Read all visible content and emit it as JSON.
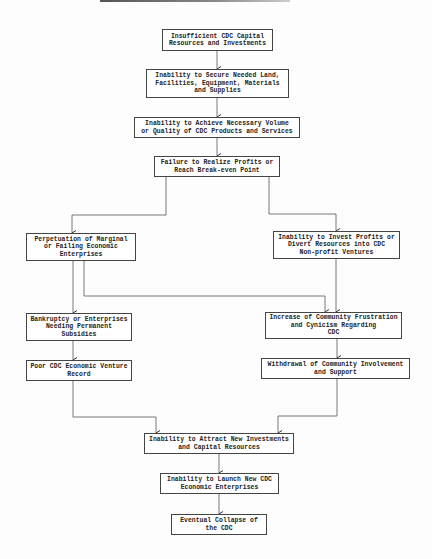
{
  "diagram": {
    "type": "flowchart",
    "nodes": {
      "n1": "Insufficient CDC Capital\nResources and Investments",
      "n2": "Inability to Secure Needed Land,\nFacilities, Equipment, Materials\nand Supplies",
      "n3": "Inability to Achieve Necessary Volume\nor Quality of CDC Products and Services",
      "n4": "Failure to Realize Profits or\nReach Break-even Point",
      "n5": "Perpetuation of Marginal\nor Failing Economic\nEnterprises",
      "n6": "Inability to Invest Profits or\nDivert Resources into CDC\nNon-profit Ventures",
      "n7": "Bankruptcy or Enterprises\nNeeding Permanent\nSubsidies",
      "n8": "Increase of Community Frustration\nand Cynicism Regarding\nCDC",
      "n9": "Poor CDC Economic Venture\nRecord",
      "n10": "Withdrawal of Community Involvement\nand Support",
      "n11": "Inability to Attract New Investments\nand Capital Resources",
      "n12": "Inability to Launch New CDC\nEconomic Enterprises",
      "n13": "Eventual Collapse of\nthe CDC"
    },
    "edges": [
      [
        "n1",
        "n2"
      ],
      [
        "n2",
        "n3"
      ],
      [
        "n3",
        "n4"
      ],
      [
        "n4",
        "n5"
      ],
      [
        "n4",
        "n6"
      ],
      [
        "n5",
        "n7"
      ],
      [
        "n5",
        "n8"
      ],
      [
        "n6",
        "n8"
      ],
      [
        "n7",
        "n9"
      ],
      [
        "n8",
        "n10"
      ],
      [
        "n9",
        "n11"
      ],
      [
        "n10",
        "n11"
      ],
      [
        "n11",
        "n12"
      ],
      [
        "n12",
        "n13"
      ]
    ],
    "colors": {
      "line": "#444444",
      "box_border": "#444444",
      "text": "#222222",
      "background": "#fdfdfd"
    }
  }
}
